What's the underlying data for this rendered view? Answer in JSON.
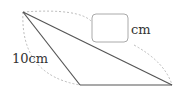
{
  "diagram": {
    "type": "triangle-geometry",
    "vertices": {
      "apex": [
        23,
        12
      ],
      "bottom_left": [
        80,
        85
      ],
      "bottom_right": [
        172,
        85
      ]
    },
    "labels": {
      "left_side": "10cm",
      "answer_unit": "cm",
      "answer_box_value": ""
    },
    "colors": {
      "edge": "#555555",
      "dashed_arc": "#bbbbbb",
      "box_border": "#aaaaaa",
      "text": "#333333"
    }
  }
}
